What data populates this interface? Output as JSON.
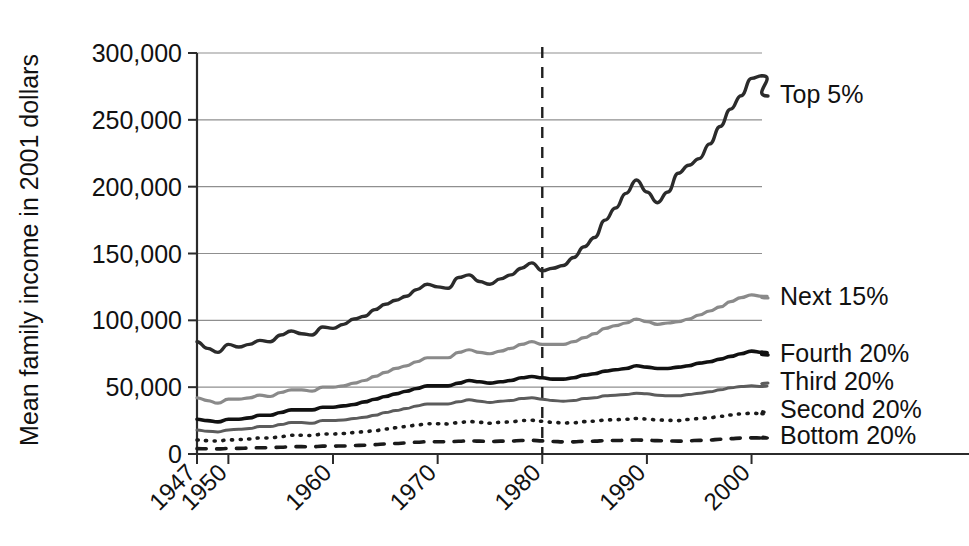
{
  "chart_data": {
    "type": "line",
    "title": "",
    "xlabel": "",
    "ylabel": "Mean family income in 2001 dollars",
    "xlim": [
      1947,
      2001
    ],
    "ylim": [
      0,
      300000
    ],
    "grid": true,
    "legend_position": "right-inline",
    "y_ticks": [
      0,
      50000,
      100000,
      150000,
      200000,
      250000,
      300000
    ],
    "y_tick_labels": [
      "0",
      "50,000",
      "100,000",
      "150,000",
      "200,000",
      "250,000",
      "300,000"
    ],
    "x_ticks": [
      1947,
      1950,
      1960,
      1970,
      1980,
      1990,
      2000
    ],
    "x_tick_labels": [
      "1947",
      "1950",
      "1960",
      "1970",
      "1980",
      "1990",
      "2000"
    ],
    "annotations": [
      {
        "name": "reference-line-1980",
        "type": "vline",
        "x": 1980,
        "style": "dashed"
      }
    ],
    "x": [
      1947,
      1948,
      1949,
      1950,
      1951,
      1952,
      1953,
      1954,
      1955,
      1956,
      1957,
      1958,
      1959,
      1960,
      1961,
      1962,
      1963,
      1964,
      1965,
      1966,
      1967,
      1968,
      1969,
      1970,
      1971,
      1972,
      1973,
      1974,
      1975,
      1976,
      1977,
      1978,
      1979,
      1980,
      1981,
      1982,
      1983,
      1984,
      1985,
      1986,
      1987,
      1988,
      1989,
      1990,
      1991,
      1992,
      1993,
      1994,
      1995,
      1996,
      1997,
      1998,
      1999,
      2000,
      2001
    ],
    "series": [
      {
        "name": "Top 5%",
        "label": "Top 5%",
        "style": "solid",
        "color": "#2b2b2b",
        "width": 3.4,
        "values": [
          84000,
          79000,
          76000,
          82000,
          80000,
          82000,
          85000,
          84000,
          89000,
          92000,
          90000,
          89000,
          95000,
          94000,
          97000,
          101000,
          103000,
          108000,
          112000,
          115000,
          118000,
          123000,
          127000,
          125000,
          124000,
          132000,
          134000,
          129000,
          127000,
          131000,
          134000,
          139000,
          143000,
          137000,
          139000,
          141000,
          147000,
          155000,
          162000,
          175000,
          184000,
          195000,
          205000,
          196000,
          188000,
          196000,
          210000,
          216000,
          221000,
          232000,
          245000,
          258000,
          268000,
          281000,
          283000
        ]
      },
      {
        "name": "Next 15%",
        "label": "Next 15%",
        "style": "solid",
        "color": "#8a8a8a",
        "width": 3.2,
        "values": [
          42000,
          40000,
          38000,
          41000,
          41000,
          42000,
          44000,
          43000,
          46000,
          48000,
          48000,
          47000,
          50000,
          50000,
          51000,
          53000,
          55000,
          58000,
          61000,
          64000,
          66000,
          69000,
          72000,
          72000,
          72000,
          76000,
          78000,
          76000,
          75000,
          77000,
          79000,
          82000,
          84000,
          82000,
          82000,
          82000,
          84000,
          87000,
          90000,
          94000,
          96000,
          98000,
          101000,
          99000,
          97000,
          98000,
          99000,
          101000,
          104000,
          107000,
          110000,
          114000,
          117000,
          119000,
          118000
        ]
      },
      {
        "name": "Fourth 20%",
        "label": "Fourth 20%",
        "style": "solid",
        "color": "#111111",
        "width": 3.6,
        "values": [
          26000,
          25000,
          24000,
          26000,
          26000,
          27000,
          29000,
          29000,
          31000,
          33000,
          33000,
          33000,
          35000,
          35000,
          36000,
          37000,
          39000,
          41000,
          43000,
          45000,
          47000,
          49000,
          51000,
          51000,
          51000,
          53000,
          55000,
          54000,
          53000,
          54000,
          55000,
          57000,
          58000,
          57000,
          56000,
          56000,
          57000,
          59000,
          60000,
          62000,
          63000,
          64000,
          66000,
          65000,
          64000,
          64000,
          65000,
          66000,
          68000,
          69000,
          71000,
          73000,
          75000,
          77000,
          76000
        ]
      },
      {
        "name": "Third 20%",
        "label": "Third 20%",
        "style": "solid",
        "color": "#5c5c5c",
        "width": 3.0,
        "values": [
          18000,
          17000,
          16500,
          18000,
          18500,
          19000,
          20500,
          20500,
          22000,
          23500,
          23500,
          23000,
          25000,
          25000,
          25500,
          26500,
          27500,
          29000,
          31000,
          32500,
          34000,
          36000,
          37500,
          37500,
          37500,
          39000,
          40500,
          39500,
          38500,
          39500,
          40000,
          41500,
          42000,
          41000,
          40000,
          39500,
          40000,
          41500,
          42000,
          43500,
          44000,
          44500,
          45500,
          45000,
          44000,
          43500,
          43500,
          44500,
          45500,
          46500,
          48000,
          49500,
          50500,
          51000,
          50500
        ]
      },
      {
        "name": "Second 20%",
        "label": "Second 20%",
        "style": "dotted",
        "color": "#1a1a1a",
        "width": 3.6,
        "values": [
          10500,
          10000,
          9700,
          10500,
          10800,
          11200,
          12000,
          12000,
          13000,
          14000,
          14000,
          13800,
          15000,
          15000,
          15300,
          16000,
          16600,
          17500,
          18700,
          19600,
          20500,
          21700,
          22600,
          22600,
          22500,
          23400,
          24300,
          23700,
          23000,
          23700,
          24000,
          25000,
          25200,
          24500,
          23700,
          23200,
          23400,
          24200,
          24500,
          25400,
          25700,
          26000,
          26600,
          26200,
          25500,
          25200,
          25000,
          25800,
          26500,
          27200,
          28200,
          29200,
          30000,
          30500,
          30200
        ]
      },
      {
        "name": "Bottom 20%",
        "label": "Bottom 20%",
        "style": "dashed",
        "color": "#1a1a1a",
        "width": 3.6,
        "values": [
          4000,
          3900,
          3800,
          4100,
          4200,
          4400,
          4700,
          4700,
          5100,
          5500,
          5500,
          5400,
          5900,
          5900,
          6000,
          6300,
          6600,
          7000,
          7500,
          7900,
          8300,
          8800,
          9200,
          9200,
          9100,
          9500,
          9900,
          9600,
          9300,
          9600,
          9700,
          10100,
          10200,
          9800,
          9400,
          9100,
          9100,
          9500,
          9600,
          10000,
          10100,
          10200,
          10500,
          10300,
          10000,
          9800,
          9600,
          9900,
          10200,
          10500,
          11000,
          11500,
          11900,
          12100,
          12000
        ]
      }
    ]
  }
}
